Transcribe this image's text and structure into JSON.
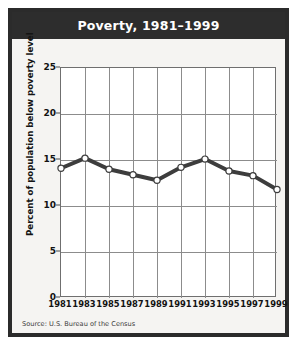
{
  "figure": {
    "title": "Poverty, 1981–1999",
    "source": "Source: U.S. Bureau of the Census",
    "frame_color": "#2b2b2b",
    "title_bar_color": "#2d2d2d",
    "title_text_color": "#ffffff",
    "background_color": "#f4f3f1",
    "plot_background_color": "#ffffff",
    "grid_color": "#8c8c8c",
    "series_color": "#3d3d3d",
    "marker_fill_color": "#ffffff"
  },
  "chart_data": {
    "type": "line",
    "title": "Poverty, 1981–1999",
    "xlabel": "",
    "ylabel": "Percent of population below poverty level",
    "x": [
      1981,
      1983,
      1985,
      1987,
      1989,
      1991,
      1993,
      1995,
      1997,
      1999
    ],
    "values": [
      14.1,
      15.2,
      14.0,
      13.4,
      12.8,
      14.2,
      15.1,
      13.8,
      13.3,
      11.8
    ],
    "series": [
      {
        "name": "Percent of population below poverty level",
        "values": [
          14.1,
          15.2,
          14.0,
          13.4,
          12.8,
          14.2,
          15.1,
          13.8,
          13.3,
          11.8
        ]
      }
    ],
    "xticks": [
      "1981",
      "1983",
      "1985",
      "1987",
      "1989",
      "1991",
      "1993",
      "1995",
      "1997",
      "1999"
    ],
    "yticks": [
      0,
      5,
      10,
      15,
      20,
      25
    ],
    "ytick_labels": [
      "0",
      "5",
      "10",
      "15",
      "20",
      "25"
    ],
    "ylim": [
      0,
      25
    ],
    "xlim": [
      1981,
      1999
    ],
    "grid": true,
    "legend": "none",
    "marker": "circle-open",
    "source": "Source: U.S. Bureau of the Census"
  }
}
